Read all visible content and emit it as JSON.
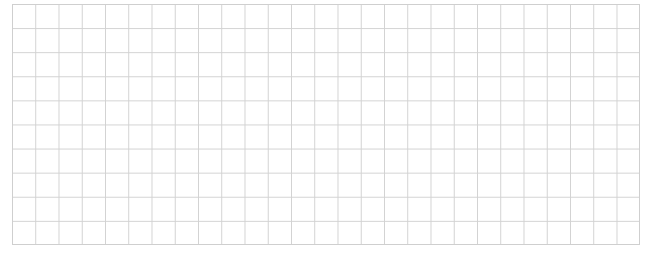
{
  "grid": {
    "columns": 27,
    "rows": 10,
    "line_color": "#d2d2d2",
    "background_color": "#ffffff"
  }
}
